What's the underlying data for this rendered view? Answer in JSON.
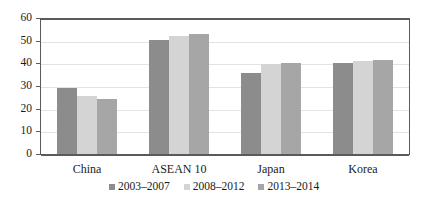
{
  "chart_data": {
    "type": "bar",
    "title": "",
    "subtitle": "",
    "xlabel": "",
    "ylabel": "",
    "categories": [
      "China",
      "ASEAN 10",
      "Japan",
      "Korea"
    ],
    "series": [
      {
        "name": "2003–2007",
        "color": "#8c8c8c",
        "values": [
          29.3,
          50.6,
          36.2,
          40.3
        ]
      },
      {
        "name": "2008–2012",
        "color": "#d4d4d4",
        "values": [
          26.0,
          52.3,
          39.9,
          41.2
        ]
      },
      {
        "name": "2013–2014",
        "color": "#a6a6a6",
        "values": [
          24.6,
          53.4,
          40.3,
          41.7
        ]
      }
    ],
    "ylim": [
      0,
      60
    ],
    "ytick_labels": [
      "60",
      "50",
      "40",
      "30",
      "20",
      "10",
      "0"
    ],
    "ytick_values": [
      60,
      50,
      40,
      30,
      20,
      10,
      0
    ],
    "grid": true,
    "grid_axis": "y",
    "legend_position": "bottom",
    "plot_border": true,
    "background_color": "#ffffff",
    "axis_color": "#5a5a5a",
    "gridline_color": "#e3e3e3"
  }
}
